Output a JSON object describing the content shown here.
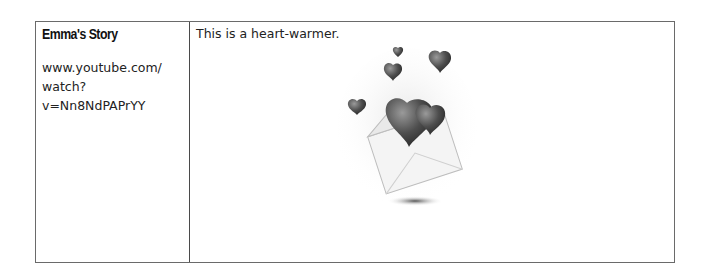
{
  "table": {
    "rows": [
      {
        "title": "Emma's Story",
        "url_line1": "www.youtube.com/",
        "url_line2": "watch?v=Nn8NdPAPrYY",
        "description": "This is a heart-warmer.",
        "image": "envelope-with-hearts-illustration"
      }
    ]
  }
}
